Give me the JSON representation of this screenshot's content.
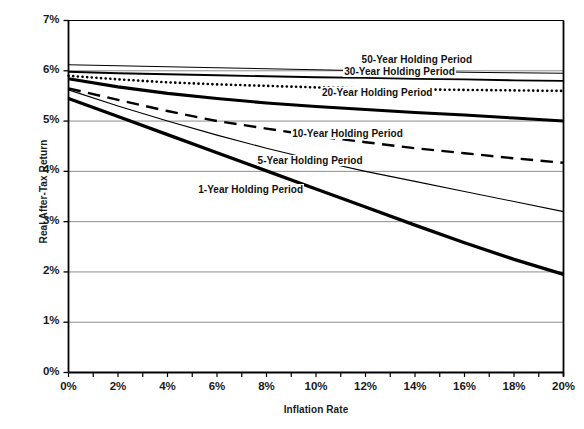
{
  "chart_data": {
    "type": "line",
    "title": "",
    "xlabel": "Inflation Rate",
    "ylabel": "Real After-Tax Return",
    "xlim": [
      0,
      20
    ],
    "ylim": [
      0,
      7
    ],
    "grid": true,
    "grid_axis": "y",
    "legend_position": "inline-labels",
    "x_tick_labels": [
      "0%",
      "2%",
      "4%",
      "6%",
      "8%",
      "10%",
      "12%",
      "14%",
      "16%",
      "18%",
      "20%"
    ],
    "x_tick_values": [
      0,
      2,
      4,
      6,
      8,
      10,
      12,
      14,
      16,
      18,
      20
    ],
    "x_minor_tick_interval": 1,
    "y_tick_labels": [
      "0%",
      "1%",
      "2%",
      "3%",
      "4%",
      "5%",
      "6%",
      "7%"
    ],
    "y_tick_values": [
      0,
      1,
      2,
      3,
      4,
      5,
      6,
      7
    ],
    "x": [
      0,
      2,
      4,
      6,
      8,
      10,
      12,
      14,
      16,
      18,
      20
    ],
    "series": [
      {
        "name": "50-Year Holding Period",
        "label": "50-Year Holding Period",
        "style": "thin-solid",
        "color": "#000000",
        "width": 1.1,
        "values": [
          6.12,
          6.1,
          6.08,
          6.06,
          6.04,
          6.02,
          6.0,
          5.99,
          5.97,
          5.96,
          5.95
        ]
      },
      {
        "name": "30-Year Holding Period",
        "label": "30-Year Holding Period",
        "style": "medium-solid",
        "color": "#000000",
        "width": 1.9,
        "values": [
          5.98,
          5.95,
          5.93,
          5.91,
          5.89,
          5.87,
          5.86,
          5.84,
          5.83,
          5.81,
          5.8
        ]
      },
      {
        "name": "20-Year Holding Period (dotted)",
        "label": "20-Year Holding Period",
        "style": "dotted",
        "color": "#000000",
        "width": 2.6,
        "values": [
          5.9,
          5.83,
          5.77,
          5.73,
          5.7,
          5.67,
          5.65,
          5.63,
          5.62,
          5.61,
          5.6
        ]
      },
      {
        "name": "20-Year Holding Period (thick)",
        "label": "",
        "style": "thick-solid",
        "color": "#000000",
        "width": 3.1,
        "values": [
          5.84,
          5.68,
          5.55,
          5.45,
          5.36,
          5.29,
          5.23,
          5.17,
          5.12,
          5.06,
          5.0
        ]
      },
      {
        "name": "10-Year Holding Period",
        "label": "10-Year Holding Period",
        "style": "dashed",
        "color": "#000000",
        "width": 2.4,
        "values": [
          5.65,
          5.42,
          5.2,
          5.0,
          4.85,
          4.7,
          4.58,
          4.46,
          4.36,
          4.26,
          4.17
        ]
      },
      {
        "name": "5-Year Holding Period",
        "label": "5-Year Holding Period",
        "style": "thin-solid",
        "color": "#000000",
        "width": 1.1,
        "values": [
          5.62,
          5.3,
          5.0,
          4.72,
          4.46,
          4.22,
          4.0,
          3.8,
          3.6,
          3.4,
          3.2
        ]
      },
      {
        "name": "1-Year Holding Period",
        "label": "1-Year Holding Period",
        "style": "thick-solid",
        "color": "#000000",
        "width": 3.3,
        "values": [
          5.45,
          5.09,
          4.73,
          4.37,
          4.01,
          3.65,
          3.29,
          2.93,
          2.58,
          2.25,
          1.95
        ]
      }
    ],
    "inline_labels": [
      {
        "text": "50-Year Holding Period",
        "x": 11.8,
        "y": 6.22
      },
      {
        "text": "30-Year Holding Period",
        "x": 11.1,
        "y": 5.98
      },
      {
        "text": "20-Year Holding Period",
        "x": 10.2,
        "y": 5.55
      },
      {
        "text": "10-Year Holding Period",
        "x": 9.0,
        "y": 4.75
      },
      {
        "text": "5-Year Holding Period",
        "x": 7.6,
        "y": 4.2
      },
      {
        "text": "1-Year Holding Period",
        "x": 5.2,
        "y": 3.62
      }
    ]
  },
  "colors": {
    "background": "#ffffff",
    "axis": "#000000",
    "grid": "#808080",
    "text": "#1a1a1a"
  }
}
